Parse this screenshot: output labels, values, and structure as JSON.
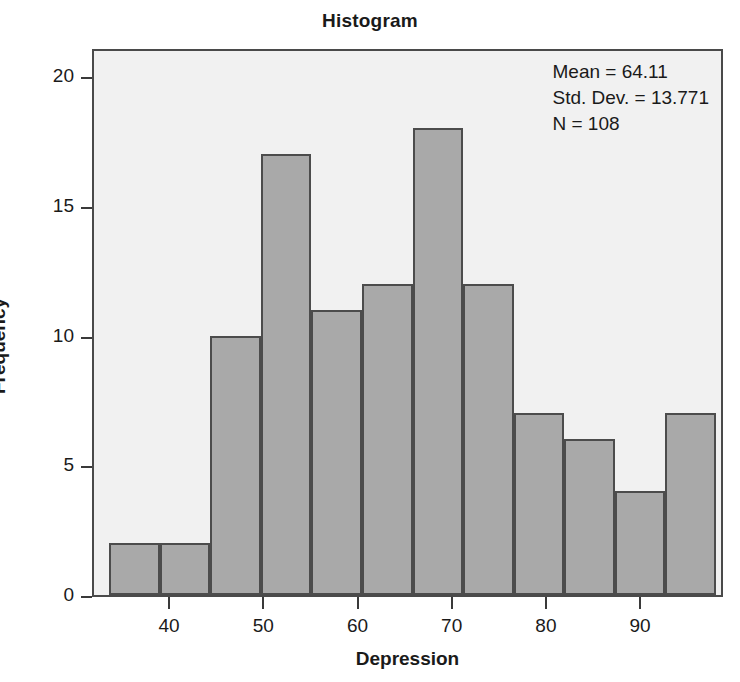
{
  "chart_data": {
    "type": "bar",
    "title": "Histogram",
    "xlabel": "Depression",
    "ylabel": "Frequency",
    "categories": [
      "35-40",
      "40-45",
      "45-50",
      "50-55",
      "55-60",
      "60-65",
      "65-70",
      "70-75",
      "75-80",
      "80-85",
      "85-90",
      "90-95"
    ],
    "bin_edges": [
      35,
      40,
      45,
      50,
      55,
      60,
      65,
      70,
      75,
      80,
      85,
      90,
      95
    ],
    "bin_width": 5,
    "values": [
      2,
      2,
      10,
      17,
      11,
      12,
      18,
      12,
      7,
      6,
      4,
      7
    ],
    "xlim": [
      33.5,
      95.5
    ],
    "ylim": [
      0,
      21
    ],
    "xticks": [
      40,
      50,
      60,
      70,
      80,
      90
    ],
    "xtick_labels": [
      "40",
      "50",
      "60",
      "70",
      "80",
      "90"
    ],
    "yticks": [
      0,
      5,
      10,
      15,
      20
    ],
    "ytick_labels": [
      "0",
      "5",
      "10",
      "15",
      "20"
    ],
    "grid": false,
    "legend": false,
    "bar_color": "#a9a9a9",
    "bar_edge_color": "#4c4c4c",
    "plot_background": "#f1f1f1",
    "frame_color": "#4a4a4a"
  },
  "annotation": {
    "mean_label": "Mean = 64.11",
    "std_dev_label": "Std. Dev. = 13.771",
    "n_label": "N = 108"
  },
  "axis": {
    "y_label": "Frequency",
    "x_label": "Depression",
    "y_tick_0": "0",
    "y_tick_1": "5",
    "y_tick_2": "10",
    "y_tick_3": "15",
    "y_tick_4": "20",
    "x_tick_0": "40",
    "x_tick_1": "50",
    "x_tick_2": "60",
    "x_tick_3": "70",
    "x_tick_4": "80",
    "x_tick_5": "90"
  },
  "header": {
    "title": "Histogram"
  }
}
